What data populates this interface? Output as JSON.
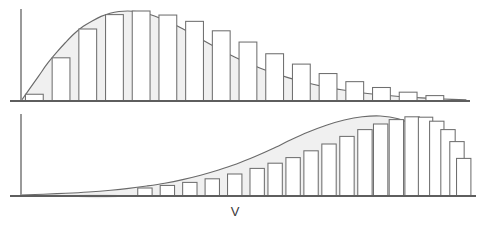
{
  "figure": {
    "title": "",
    "background_color": "#ffffff",
    "axis_color": "#5e5e5e",
    "curve_stroke_color": "#6a6a6a",
    "curve_fill_color": "#f0f0f0",
    "bar_fill_color": "#ffffff",
    "bar_stroke_color": "#6f6f6f"
  },
  "chart_data": [
    {
      "id": "top-panel",
      "type": "area",
      "title": "",
      "subtitle": "",
      "xlabel": "",
      "ylabel": "",
      "xlim": [
        0,
        100
      ],
      "ylim": [
        0,
        1
      ],
      "grid": false,
      "legend": null,
      "annotations": [],
      "description": "Right-skewed unimodal density curve with inscribed rectangle bars (Riemann sum), peak near the left third, long tail to the right",
      "axes": {
        "x_axis_visible": true,
        "y_axis_visible": true,
        "x_tick_labels": [],
        "y_tick_labels": []
      },
      "curve": {
        "name": "density",
        "x": [
          0,
          2,
          4,
          6,
          8,
          10,
          12,
          14,
          16,
          18,
          20,
          22,
          24,
          26,
          28,
          30,
          32,
          34,
          36,
          38,
          40,
          44,
          48,
          52,
          56,
          60,
          64,
          68,
          72,
          76,
          80,
          85,
          90,
          95,
          100
        ],
        "y": [
          0.0,
          0.14,
          0.28,
          0.42,
          0.54,
          0.65,
          0.75,
          0.83,
          0.89,
          0.94,
          0.975,
          0.995,
          1.0,
          0.995,
          0.975,
          0.945,
          0.905,
          0.86,
          0.81,
          0.755,
          0.7,
          0.59,
          0.49,
          0.4,
          0.325,
          0.26,
          0.205,
          0.16,
          0.125,
          0.095,
          0.072,
          0.05,
          0.034,
          0.022,
          0.012
        ]
      },
      "bars": {
        "count": 16,
        "bar_left_edges": [
          1,
          7,
          13,
          19,
          25,
          31,
          37,
          43,
          49,
          55,
          61,
          67,
          73,
          79,
          85,
          91
        ],
        "bar_width": 4,
        "values": [
          0.075,
          0.48,
          0.8,
          0.96,
          1.0,
          0.955,
          0.885,
          0.78,
          0.655,
          0.525,
          0.41,
          0.305,
          0.215,
          0.15,
          0.098,
          0.06
        ]
      }
    },
    {
      "id": "bottom-panel",
      "type": "area",
      "title": "",
      "subtitle": "",
      "xlabel": "",
      "ylabel": "",
      "xlim": [
        0,
        100
      ],
      "ylim": [
        0,
        1
      ],
      "grid": false,
      "legend": null,
      "description": "Left-skewed (mirrored) unimodal density curve with inscribed rectangle bars, long tail to the left, peak near the right third",
      "axes": {
        "x_axis_visible": true,
        "y_axis_visible": true,
        "x_tick_labels": [
          "V"
        ],
        "y_tick_labels": []
      },
      "annotations": [
        {
          "text": "V",
          "x": 47,
          "y": 0,
          "position": "below-axis"
        }
      ],
      "curve": {
        "name": "density",
        "x": [
          0,
          5,
          10,
          15,
          20,
          24,
          28,
          32,
          36,
          40,
          44,
          48,
          52,
          56,
          60,
          64,
          68,
          72,
          76,
          80,
          84,
          88,
          90,
          92,
          94,
          96,
          98,
          100
        ],
        "y": [
          0.012,
          0.022,
          0.034,
          0.05,
          0.072,
          0.095,
          0.125,
          0.16,
          0.205,
          0.26,
          0.325,
          0.4,
          0.49,
          0.59,
          0.7,
          0.8,
          0.885,
          0.95,
          0.99,
          1.0,
          0.965,
          0.87,
          0.79,
          0.68,
          0.55,
          0.4,
          0.22,
          0.0
        ]
      },
      "bars": {
        "count": 20,
        "bar_left_edges": [
          26,
          31,
          36,
          41,
          46,
          51,
          55,
          59,
          63,
          67,
          71,
          75,
          78.5,
          82,
          85.5,
          88.5,
          91,
          93.5,
          95.5,
          97
        ],
        "bar_width": 3.2,
        "values": [
          0.1,
          0.132,
          0.17,
          0.215,
          0.275,
          0.345,
          0.41,
          0.48,
          0.565,
          0.65,
          0.745,
          0.83,
          0.9,
          0.955,
          0.99,
          0.985,
          0.935,
          0.83,
          0.68,
          0.47
        ]
      }
    }
  ]
}
